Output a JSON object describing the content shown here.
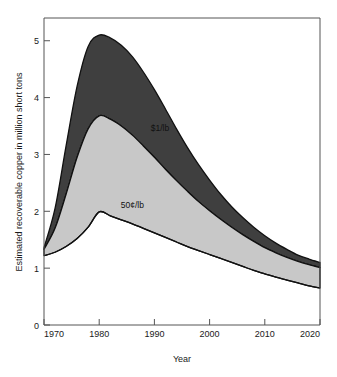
{
  "chart_data": {
    "type": "area",
    "title": "",
    "subtitle": "",
    "xlabel": "Year",
    "ylabel": "Estimated recoverable copper in million short tons",
    "xlim": [
      1970,
      2020
    ],
    "ylim": [
      0,
      5.4
    ],
    "grid": false,
    "legend_position": "inline-annotations",
    "xticks": [
      1970,
      1980,
      1990,
      2000,
      2010,
      2020
    ],
    "xtick_labels": [
      "1970",
      "1980",
      "1990",
      "2000",
      "2010",
      "2020"
    ],
    "yticks": [
      0,
      1,
      2,
      3,
      4,
      5
    ],
    "ytick_labels": [
      "0",
      "1",
      "2",
      "3",
      "4",
      "5"
    ],
    "x": [
      1970,
      1972,
      1974,
      1976,
      1978,
      1980,
      1982,
      1984,
      1986,
      1988,
      1990,
      1992,
      1994,
      1996,
      1998,
      2000,
      2002,
      2004,
      2006,
      2008,
      2010,
      2012,
      2014,
      2016,
      2018,
      2020
    ],
    "series": [
      {
        "name": "50¢/lb",
        "label": "50¢/lb",
        "fill_color": "#c8c8c8",
        "line_color": "#111111",
        "values": [
          1.22,
          1.28,
          1.38,
          1.52,
          1.72,
          1.99,
          1.92,
          1.85,
          1.78,
          1.7,
          1.62,
          1.54,
          1.46,
          1.38,
          1.31,
          1.24,
          1.17,
          1.1,
          1.03,
          0.96,
          0.9,
          0.84,
          0.79,
          0.74,
          0.69,
          0.65
        ]
      },
      {
        "name": "$1/lb",
        "label": "$1/lb",
        "fill_color": "#c8c8c8",
        "line_color": "#111111",
        "values": [
          1.33,
          1.7,
          2.3,
          2.95,
          3.45,
          3.68,
          3.62,
          3.5,
          3.34,
          3.15,
          2.95,
          2.74,
          2.54,
          2.35,
          2.17,
          2.01,
          1.86,
          1.72,
          1.59,
          1.47,
          1.36,
          1.27,
          1.19,
          1.12,
          1.06,
          1.01
        ]
      },
      {
        "name": "$2/lb",
        "label": "$2/lb",
        "fill_color": "#3f3f3f",
        "line_color": "#111111",
        "values": [
          1.36,
          2.05,
          3.15,
          4.2,
          4.9,
          5.1,
          5.05,
          4.92,
          4.72,
          4.45,
          4.14,
          3.8,
          3.45,
          3.12,
          2.82,
          2.55,
          2.3,
          2.08,
          1.89,
          1.72,
          1.57,
          1.44,
          1.33,
          1.23,
          1.16,
          1.1
        ]
      }
    ],
    "annotations": [
      {
        "text": "$2/lb",
        "x": 1993,
        "y": 4.55,
        "color": "#ffffff"
      },
      {
        "text": "$1/lb",
        "x": 1991,
        "y": 3.42,
        "color": "#111111"
      },
      {
        "text": "50¢/lb",
        "x": 1986,
        "y": 2.05,
        "color": "#111111"
      }
    ]
  }
}
